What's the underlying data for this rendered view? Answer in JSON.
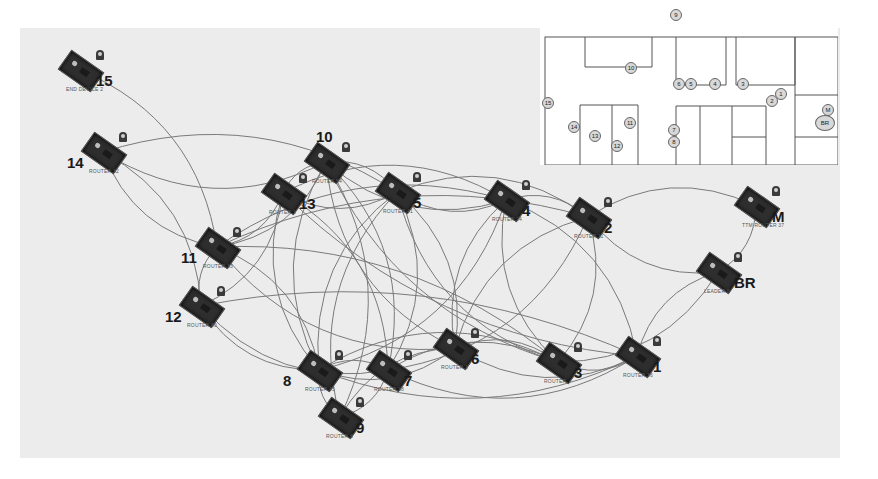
{
  "diagram": {
    "type": "mesh-network-topology",
    "link_color": "#7a7a7a",
    "background": "#ececec",
    "nodes": [
      {
        "id": "15",
        "label": "15",
        "sublabel": "END DEVICE 2",
        "x": 80,
        "y": 70
      },
      {
        "id": "14",
        "label": "14",
        "sublabel": "ROUTER 32",
        "x": 103,
        "y": 152
      },
      {
        "id": "10",
        "label": "10",
        "sublabel": "ROUTER 54",
        "x": 326,
        "y": 162
      },
      {
        "id": "13",
        "label": "13",
        "sublabel": "ROUTER 1",
        "x": 283,
        "y": 193
      },
      {
        "id": "5",
        "label": "5",
        "sublabel": "ROUTER 41",
        "x": 397,
        "y": 192
      },
      {
        "id": "4",
        "label": "4",
        "sublabel": "ROUTER 24",
        "x": 506,
        "y": 200
      },
      {
        "id": "2",
        "label": "2",
        "sublabel": "ROUTER 11",
        "x": 588,
        "y": 217
      },
      {
        "id": "M",
        "label": "M",
        "sublabel": "TTM ROUTER 37",
        "x": 756,
        "y": 206
      },
      {
        "id": "11",
        "label": "11",
        "sublabel": "ROUTER 33",
        "x": 217,
        "y": 247
      },
      {
        "id": "BR",
        "label": "BR",
        "sublabel": "LEADER 8",
        "x": 718,
        "y": 272
      },
      {
        "id": "12",
        "label": "12",
        "sublabel": "ROUTER 60",
        "x": 201,
        "y": 306
      },
      {
        "id": "6",
        "label": "6",
        "sublabel": "ROUTER 1",
        "x": 455,
        "y": 348
      },
      {
        "id": "3",
        "label": "3",
        "sublabel": "ROUTER",
        "x": 558,
        "y": 362
      },
      {
        "id": "1",
        "label": "1",
        "sublabel": "ROUTER 36",
        "x": 637,
        "y": 356
      },
      {
        "id": "8",
        "label": "8",
        "sublabel": "ROUTER 45",
        "x": 319,
        "y": 370
      },
      {
        "id": "7",
        "label": "7",
        "sublabel": "ROUTER 38",
        "x": 388,
        "y": 370
      },
      {
        "id": "9",
        "label": "9",
        "sublabel": "ROUTER 6",
        "x": 340,
        "y": 417
      }
    ],
    "links": [
      [
        "15",
        "11"
      ],
      [
        "14",
        "10"
      ],
      [
        "14",
        "5"
      ],
      [
        "14",
        "11"
      ],
      [
        "14",
        "12"
      ],
      [
        "10",
        "13"
      ],
      [
        "10",
        "5"
      ],
      [
        "10",
        "4"
      ],
      [
        "10",
        "11"
      ],
      [
        "10",
        "8"
      ],
      [
        "10",
        "7"
      ],
      [
        "10",
        "6"
      ],
      [
        "10",
        "9"
      ],
      [
        "10",
        "3"
      ],
      [
        "13",
        "11"
      ],
      [
        "13",
        "5"
      ],
      [
        "13",
        "4"
      ],
      [
        "13",
        "8"
      ],
      [
        "13",
        "7"
      ],
      [
        "13",
        "1"
      ],
      [
        "13",
        "12"
      ],
      [
        "5",
        "4"
      ],
      [
        "5",
        "2"
      ],
      [
        "5",
        "8"
      ],
      [
        "5",
        "7"
      ],
      [
        "5",
        "3"
      ],
      [
        "5",
        "6"
      ],
      [
        "5",
        "9"
      ],
      [
        "4",
        "2"
      ],
      [
        "4",
        "11"
      ],
      [
        "4",
        "1"
      ],
      [
        "4",
        "3"
      ],
      [
        "4",
        "8"
      ],
      [
        "4",
        "6"
      ],
      [
        "2",
        "M"
      ],
      [
        "2",
        "BR"
      ],
      [
        "2",
        "3"
      ],
      [
        "2",
        "6"
      ],
      [
        "2",
        "7"
      ],
      [
        "2",
        "11"
      ],
      [
        "M",
        "BR"
      ],
      [
        "BR",
        "1"
      ],
      [
        "BR",
        "3"
      ],
      [
        "11",
        "12"
      ],
      [
        "11",
        "8"
      ],
      [
        "11",
        "6"
      ],
      [
        "11",
        "3"
      ],
      [
        "12",
        "8"
      ],
      [
        "12",
        "1"
      ],
      [
        "12",
        "7"
      ],
      [
        "6",
        "3"
      ],
      [
        "6",
        "1"
      ],
      [
        "6",
        "8"
      ],
      [
        "6",
        "9"
      ],
      [
        "8",
        "7"
      ],
      [
        "8",
        "9"
      ],
      [
        "8",
        "3"
      ],
      [
        "8",
        "1"
      ],
      [
        "7",
        "9"
      ],
      [
        "7",
        "1"
      ],
      [
        "7",
        "3"
      ],
      [
        "3",
        "1"
      ]
    ]
  },
  "floorplan": {
    "title": "Node placement floor plan",
    "markers": [
      {
        "label": "9",
        "x": 135,
        "y": 9
      },
      {
        "label": "10",
        "x": 90,
        "y": 62
      },
      {
        "label": "6",
        "x": 138,
        "y": 78
      },
      {
        "label": "5",
        "x": 150,
        "y": 78
      },
      {
        "label": "4",
        "x": 174,
        "y": 78
      },
      {
        "label": "3",
        "x": 202,
        "y": 78
      },
      {
        "label": "1",
        "x": 240,
        "y": 88
      },
      {
        "label": "2",
        "x": 231,
        "y": 95
      },
      {
        "label": "15",
        "x": 7,
        "y": 97
      },
      {
        "label": "M",
        "x": 287,
        "y": 104
      },
      {
        "label": "BR",
        "x": 284,
        "y": 117,
        "big": true
      },
      {
        "label": "11",
        "x": 89,
        "y": 117
      },
      {
        "label": "14",
        "x": 33,
        "y": 121
      },
      {
        "label": "13",
        "x": 54,
        "y": 130
      },
      {
        "label": "7",
        "x": 133,
        "y": 124
      },
      {
        "label": "12",
        "x": 76,
        "y": 140
      },
      {
        "label": "8",
        "x": 133,
        "y": 136
      }
    ]
  }
}
